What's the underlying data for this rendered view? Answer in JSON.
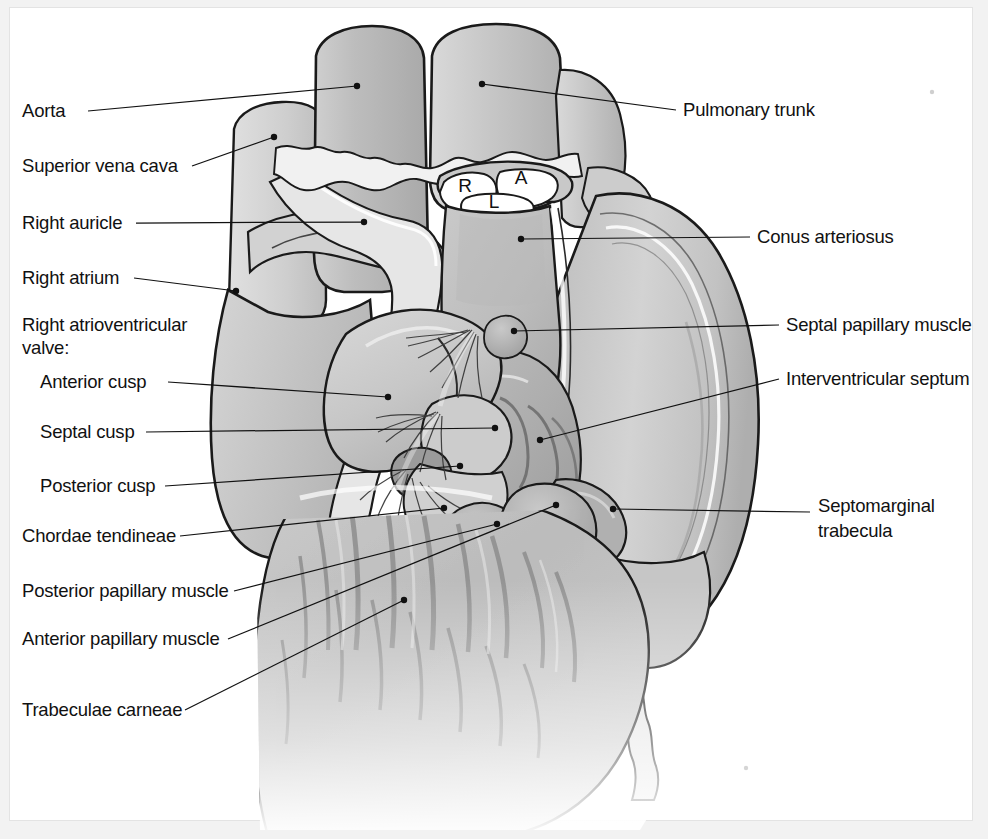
{
  "figure": {
    "type": "anatomical-illustration",
    "style": "grayscale line drawing with stipple shading",
    "background_color": "#ffffff",
    "frame_color": "#f2f2f2",
    "ink_color": "#111111"
  },
  "valve_cusp_letters": [
    {
      "id": "R",
      "label": "R",
      "meaning": "right cusp of pulmonary valve",
      "x": 465,
      "y": 192
    },
    {
      "id": "L",
      "label": "L",
      "meaning": "left cusp of pulmonary valve",
      "x": 494,
      "y": 208
    },
    {
      "id": "A",
      "label": "A",
      "meaning": "anterior cusp of pulmonary valve",
      "x": 521,
      "y": 184
    }
  ],
  "labels_left": [
    {
      "id": "aorta",
      "text": "Aorta",
      "x": 22,
      "y": 117,
      "indent": false
    },
    {
      "id": "superior-vena-cava",
      "text": "Superior vena cava",
      "x": 22,
      "y": 172,
      "indent": false
    },
    {
      "id": "right-auricle",
      "text": "Right auricle",
      "x": 22,
      "y": 229,
      "indent": false
    },
    {
      "id": "right-atrium",
      "text": "Right atrium",
      "x": 22,
      "y": 284,
      "indent": false
    },
    {
      "id": "right-av-valve-1",
      "text": "Right atrioventricular",
      "x": 22,
      "y": 331,
      "indent": false
    },
    {
      "id": "right-av-valve-2",
      "text": "valve:",
      "x": 22,
      "y": 354,
      "indent": false
    },
    {
      "id": "anterior-cusp",
      "text": "Anterior cusp",
      "x": 40,
      "y": 388,
      "indent": true
    },
    {
      "id": "septal-cusp",
      "text": "Septal cusp",
      "x": 40,
      "y": 438,
      "indent": true
    },
    {
      "id": "posterior-cusp",
      "text": "Posterior cusp",
      "x": 40,
      "y": 492,
      "indent": true
    },
    {
      "id": "chordae-tendineae",
      "text": "Chordae tendineae",
      "x": 22,
      "y": 542,
      "indent": false
    },
    {
      "id": "posterior-papillary-muscle",
      "text": "Posterior papillary muscle",
      "x": 22,
      "y": 597,
      "indent": false
    },
    {
      "id": "anterior-papillary-muscle",
      "text": "Anterior papillary muscle",
      "x": 22,
      "y": 645,
      "indent": false
    },
    {
      "id": "trabeculae-carneae",
      "text": "Trabeculae carneae",
      "x": 22,
      "y": 716,
      "indent": false
    }
  ],
  "labels_right": [
    {
      "id": "pulmonary-trunk",
      "text": "Pulmonary trunk",
      "x": 683,
      "y": 116
    },
    {
      "id": "conus-arteriosus",
      "text": "Conus arteriosus",
      "x": 757,
      "y": 243
    },
    {
      "id": "septal-papillary-muscle",
      "text": "Septal papillary muscle",
      "x": 786,
      "y": 331
    },
    {
      "id": "interventricular-septum",
      "text": "Interventricular septum",
      "x": 786,
      "y": 385
    },
    {
      "id": "septomarginal-1",
      "text": "Septomarginal",
      "x": 818,
      "y": 512
    },
    {
      "id": "septomarginal-2",
      "text": "trabecula",
      "x": 818,
      "y": 537
    }
  ],
  "leaders": [
    {
      "id": "leader-aorta",
      "d": "M 88 111 L 357 86",
      "dot": [
        357,
        86
      ]
    },
    {
      "id": "leader-superior-vena-cava",
      "d": "M 192 166 L 274 137",
      "dot": [
        274,
        137
      ]
    },
    {
      "id": "leader-right-auricle",
      "d": "M 136 223 L 364 222",
      "dot": [
        364,
        222
      ]
    },
    {
      "id": "leader-right-atrium",
      "d": "M 134 278 L 236 291",
      "dot": [
        236,
        291
      ]
    },
    {
      "id": "leader-anterior-cusp",
      "d": "M 168 382 L 388 397",
      "dot": [
        388,
        397
      ]
    },
    {
      "id": "leader-septal-cusp",
      "d": "M 146 432 L 495 428",
      "dot": [
        495,
        428
      ]
    },
    {
      "id": "leader-posterior-cusp",
      "d": "M 165 486 L 460 466",
      "dot": [
        460,
        466
      ]
    },
    {
      "id": "leader-chordae-tendineae",
      "d": "M 180 536 L 444 508",
      "dot": [
        444,
        508
      ]
    },
    {
      "id": "leader-posterior-papillary",
      "d": "M 234 591 L 497 524",
      "dot": [
        497,
        524
      ]
    },
    {
      "id": "leader-anterior-papillary",
      "d": "M 228 639 L 556 505",
      "dot": [
        556,
        505
      ]
    },
    {
      "id": "leader-trabeculae-carneae",
      "d": "M 185 710 L 404 600",
      "dot": [
        404,
        600
      ]
    },
    {
      "id": "leader-pulmonary-trunk",
      "d": "M 676 110 L 482 84",
      "dot": [
        482,
        84
      ]
    },
    {
      "id": "leader-conus-arteriosus",
      "d": "M 750 237 L 521 239",
      "dot": [
        521,
        239
      ]
    },
    {
      "id": "leader-septal-papillary",
      "d": "M 779 325 L 514 331",
      "dot": [
        514,
        331
      ]
    },
    {
      "id": "leader-interventricular",
      "d": "M 779 379 L 540 440",
      "dot": [
        540,
        440
      ]
    },
    {
      "id": "leader-septomarginal",
      "d": "M 810 512 L 613 509",
      "dot": [
        613,
        509
      ]
    }
  ]
}
